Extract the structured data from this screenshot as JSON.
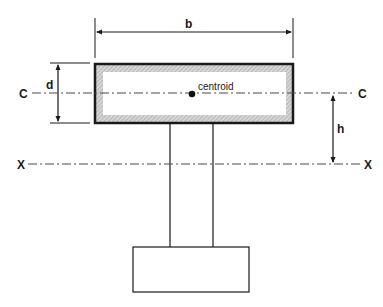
{
  "diagram": {
    "type": "T-section cross-section with centroid and reference axes",
    "labels": {
      "width_dim": "b",
      "depth_dim": "d",
      "offset_dim": "h",
      "centroid": "centroid",
      "centroid_axis_left": "C",
      "centroid_axis_right": "C",
      "reference_axis_left": "X",
      "reference_axis_right": "X"
    },
    "components": {
      "flange": "hatched rectangular flange (b × d)",
      "web": "vertical web",
      "base": "base block"
    },
    "axes": [
      {
        "name": "C-C",
        "description": "centroidal axis through flange centroid"
      },
      {
        "name": "X-X",
        "description": "reference axis"
      }
    ],
    "colors": {
      "line": "#1a1a1a",
      "hatch": "#b8b8b8",
      "background": "#ffffff"
    }
  }
}
